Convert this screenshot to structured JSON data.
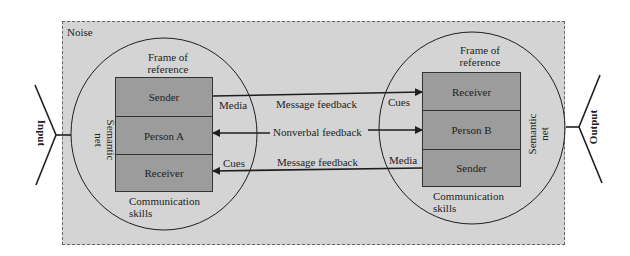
{
  "diagram": {
    "noise_label": "Noise",
    "input_label": "Input",
    "output_label": "Output",
    "person_a": {
      "frame_of_reference": [
        "Frame of",
        "reference"
      ],
      "semantic_net": [
        "Semantic",
        "net"
      ],
      "communication_skills": [
        "Communication",
        "skills"
      ],
      "rows": [
        "Sender",
        "Person A",
        "Receiver"
      ]
    },
    "person_b": {
      "frame_of_reference": [
        "Frame of",
        "reference"
      ],
      "semantic_net": [
        "Semantic",
        "net"
      ],
      "communication_skills": [
        "Communication",
        "skills"
      ],
      "rows": [
        "Receiver",
        "Person B",
        "Sender"
      ]
    },
    "channels": [
      {
        "label": "Message feedback",
        "left_tag": "Media",
        "right_tag": "Cues",
        "direction": "A-to-B"
      },
      {
        "label": "Nonverbal feedback",
        "direction": "both"
      },
      {
        "label": "Message feedback",
        "left_tag": "Cues",
        "right_tag": "Media",
        "direction": "B-to-A"
      }
    ],
    "colors": {
      "noise_bg": "#d4d4d4",
      "block_fill": "#9c9c9c",
      "line": "#1e1e1e"
    }
  }
}
